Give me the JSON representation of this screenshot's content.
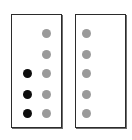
{
  "figure": {
    "background_color": "#ffffff",
    "panel_border_color": "#2b2b2b",
    "gray_dot_color": "#9a9a9a",
    "black_dot_color": "#0d0d0d"
  },
  "panels": [
    {
      "name": "left-panel",
      "columns": [
        {
          "name": "black-column",
          "dots": [
            {
              "slot": 1,
              "state": "empty"
            },
            {
              "slot": 2,
              "state": "empty"
            },
            {
              "slot": 3,
              "state": "filled"
            },
            {
              "slot": 4,
              "state": "filled"
            },
            {
              "slot": 5,
              "state": "filled"
            }
          ]
        },
        {
          "name": "gray-column",
          "dots": [
            {
              "slot": 1,
              "state": "gray"
            },
            {
              "slot": 2,
              "state": "gray"
            },
            {
              "slot": 3,
              "state": "gray"
            },
            {
              "slot": 4,
              "state": "gray"
            },
            {
              "slot": 5,
              "state": "gray"
            }
          ]
        }
      ]
    },
    {
      "name": "right-panel",
      "columns": [
        {
          "name": "gray-column",
          "dots": [
            {
              "slot": 1,
              "state": "gray"
            },
            {
              "slot": 2,
              "state": "gray"
            },
            {
              "slot": 3,
              "state": "gray"
            },
            {
              "slot": 4,
              "state": "gray"
            },
            {
              "slot": 5,
              "state": "gray"
            }
          ]
        }
      ]
    }
  ]
}
